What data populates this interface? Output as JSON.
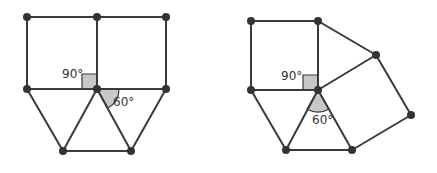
{
  "figures": [
    {
      "name": "left-figure",
      "description": "Two squares side by side with two equilateral triangles below",
      "vertices": [
        [
          27,
          17
        ],
        [
          97,
          17
        ],
        [
          166,
          17
        ],
        [
          27,
          89
        ],
        [
          97,
          89
        ],
        [
          166,
          89
        ],
        [
          63,
          151
        ],
        [
          131,
          151
        ]
      ],
      "edges": [
        [
          0,
          1
        ],
        [
          1,
          2
        ],
        [
          0,
          3
        ],
        [
          1,
          4
        ],
        [
          2,
          5
        ],
        [
          3,
          4
        ],
        [
          4,
          5
        ],
        [
          3,
          6
        ],
        [
          4,
          6
        ],
        [
          4,
          7
        ],
        [
          5,
          7
        ],
        [
          6,
          7
        ]
      ],
      "labels": {
        "right_angle": "90°",
        "triangle_angle": "60°"
      }
    },
    {
      "name": "right-figure",
      "description": "Square, rotated square and equilateral triangle meeting at a vertex",
      "vertices": [
        [
          251,
          21
        ],
        [
          318,
          21
        ],
        [
          376,
          55
        ],
        [
          411,
          115
        ],
        [
          352,
          150
        ],
        [
          286,
          150
        ],
        [
          251,
          90
        ],
        [
          318,
          90
        ]
      ],
      "edges": [
        [
          0,
          1
        ],
        [
          0,
          6
        ],
        [
          1,
          7
        ],
        [
          6,
          7
        ],
        [
          1,
          2
        ],
        [
          2,
          7
        ],
        [
          2,
          3
        ],
        [
          3,
          4
        ],
        [
          4,
          7
        ],
        [
          5,
          7
        ],
        [
          6,
          5
        ],
        [
          5,
          4
        ]
      ],
      "labels": {
        "right_angle": "90°",
        "triangle_angle": "60°"
      }
    }
  ],
  "colors": {
    "stroke": "#3a3a3a",
    "vertex": "#333333",
    "angle_fill": "#c8c8c8"
  }
}
